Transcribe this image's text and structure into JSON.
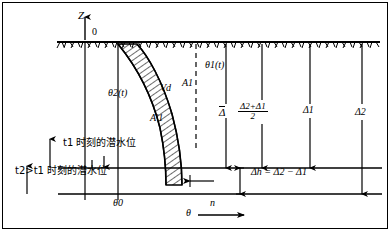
{
  "figure": {
    "type": "soil-moisture-profile-diagram",
    "axes": {
      "vertical_label": "Z",
      "origin_label": "0",
      "horizontal_label": "θ",
      "horizontal_arrow_label": "n",
      "theta0_label": "θ0"
    },
    "curves": [
      {
        "name": "theta1",
        "label": "θ1(t)",
        "description": "right moisture profile curve at time t1"
      },
      {
        "name": "theta2",
        "label": "θ2(t)",
        "description": "left moisture profile curve at time t2"
      }
    ],
    "regions": [
      {
        "name": "Vd",
        "label": "Vd",
        "description": "hatched band between the two curves"
      },
      {
        "name": "A1",
        "label": "A1",
        "description": "area right of dashed line"
      },
      {
        "name": "A1prime",
        "label": "A′1",
        "description": "area left of curve below"
      }
    ],
    "depth_labels": {
      "delta_bar": "Δ",
      "mean_fraction_numerator": "Δ2+Δ1",
      "mean_fraction_denominator": "2",
      "delta1": "Δ1",
      "delta2": "Δ2",
      "delta_h_equation": "Δh = Δ2 − Δ1"
    },
    "water_table_labels": {
      "t1": "t1 时刻的潜水位",
      "t2": "t2>t1 时刻的潜水位"
    },
    "colors": {
      "line": "#000000",
      "background": "#ffffff",
      "hatch": "#000000"
    }
  }
}
